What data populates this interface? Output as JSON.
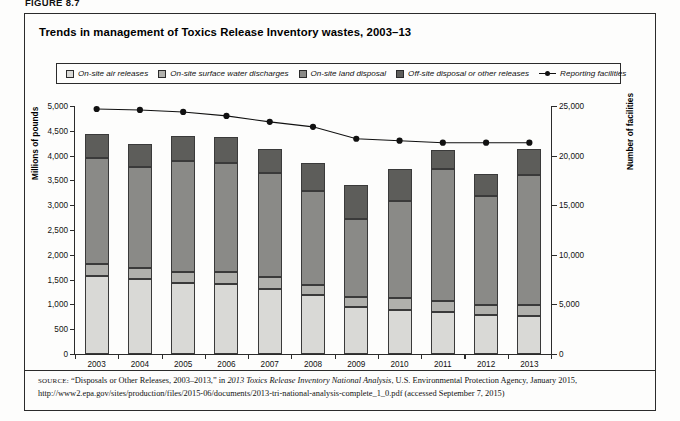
{
  "figure": {
    "label": "FIGURE 8.7",
    "title": "Trends in management of Toxics Release Inventory wastes, 2003–13"
  },
  "legend": {
    "items": [
      {
        "label": "On-site air releases",
        "color": "#d9d9d6",
        "type": "swatch",
        "name": "legend-on-site-air-releases"
      },
      {
        "label": "On-site surface water discharges",
        "color": "#b0b0ac",
        "type": "swatch",
        "name": "legend-on-site-surface-water-discharges"
      },
      {
        "label": "On-site land disposal",
        "color": "#8a8a87",
        "type": "swatch",
        "name": "legend-on-site-land-disposal"
      },
      {
        "label": "Off-site disposal or other releases",
        "color": "#5d5d5a",
        "type": "swatch",
        "name": "legend-off-site-disposal-or-other-releases"
      },
      {
        "label": "Reporting facilities",
        "color": "#111111",
        "type": "line",
        "name": "legend-reporting-facilities"
      }
    ]
  },
  "axes": {
    "left": {
      "title": "Millions of pounds",
      "min": 0,
      "max": 5000,
      "step": 500,
      "ticks": [
        "0",
        "500",
        "1,000",
        "1,500",
        "2,000",
        "2,500",
        "3,000",
        "3,500",
        "4,000",
        "4,500",
        "5,000"
      ]
    },
    "right": {
      "title": "Number of facilities",
      "min": 0,
      "max": 25000,
      "step": 5000,
      "ticks": [
        "0",
        "5,000",
        "10,000",
        "15,000",
        "20,000",
        "25,000"
      ]
    },
    "x": {
      "title": "",
      "ticks": [
        "2003",
        "2004",
        "2005",
        "2006",
        "2007",
        "2008",
        "2009",
        "2010",
        "2011",
        "2012",
        "2013"
      ]
    }
  },
  "chart_data": {
    "type": "bar",
    "title": "Trends in management of Toxics Release Inventory wastes, 2003–13",
    "subtitle": "",
    "xlabel": "",
    "ylabel": "Millions of pounds",
    "y2label": "Number of facilities",
    "ylim": [
      0,
      5000
    ],
    "y2lim": [
      0,
      25000
    ],
    "grid": false,
    "legend_position": "top",
    "stacked": true,
    "categories": [
      "2003",
      "2004",
      "2005",
      "2006",
      "2007",
      "2008",
      "2009",
      "2010",
      "2011",
      "2012",
      "2013"
    ],
    "series": [
      {
        "name": "On-site air releases",
        "color": "#d9d9d6",
        "axis": "left",
        "values": [
          1570,
          1520,
          1430,
          1420,
          1320,
          1180,
          940,
          890,
          850,
          780,
          760
        ]
      },
      {
        "name": "On-site surface water discharges",
        "color": "#b0b0ac",
        "axis": "left",
        "values": [
          240,
          210,
          230,
          240,
          240,
          220,
          210,
          230,
          210,
          210,
          220
        ]
      },
      {
        "name": "On-site land disposal",
        "color": "#8a8a87",
        "axis": "left",
        "values": [
          2140,
          2050,
          2240,
          2200,
          2080,
          1880,
          1580,
          1960,
          2680,
          2190,
          2620
        ]
      },
      {
        "name": "Off-site disposal or other releases",
        "color": "#5d5d5a",
        "axis": "left",
        "values": [
          490,
          460,
          490,
          510,
          490,
          580,
          680,
          660,
          380,
          450,
          540
        ]
      },
      {
        "name": "Reporting facilities",
        "color": "#111111",
        "axis": "right",
        "type": "line",
        "values": [
          24700,
          24600,
          24400,
          24000,
          23400,
          22900,
          21700,
          21500,
          21300,
          21300,
          21300
        ]
      }
    ],
    "totals": [
      4440,
      4240,
      4390,
      4370,
      4130,
      3860,
      3410,
      3740,
      4120,
      3630,
      4140
    ]
  },
  "source": {
    "prefix": "SOURCE:",
    "line1_a": " “Disposals or Other Releases, 2003–2013,” in ",
    "line1_italic": "2013 Toxics Release Inventory National Analysis",
    "line1_b": ", U.S. Environmental Protection Agency, January 2015, http://www2.epa.gov/sites/production/files/2015-06/documents/2013-tri-national-analysis-complete_1_0.pdf (accessed September 7, 2015)"
  }
}
